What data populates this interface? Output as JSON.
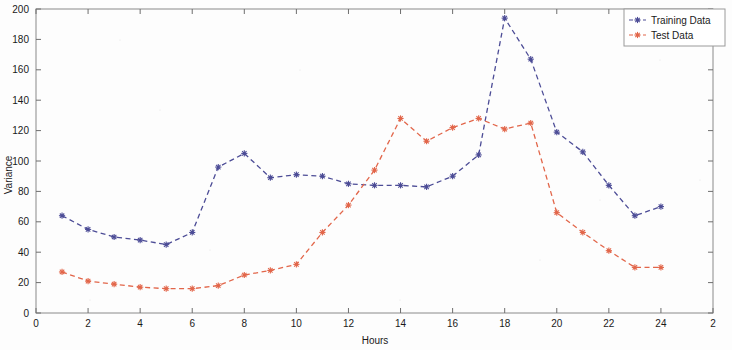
{
  "chart_data": {
    "type": "line",
    "title": "",
    "xlabel": "Hours",
    "ylabel": "Variance",
    "xlim": [
      0,
      26
    ],
    "ylim": [
      0,
      200
    ],
    "xticks": [
      0,
      2,
      4,
      6,
      8,
      10,
      12,
      14,
      16,
      18,
      20,
      22,
      24,
      26
    ],
    "xtick_labels": [
      "0",
      "2",
      "4",
      "6",
      "8",
      "10",
      "12",
      "14",
      "16",
      "18",
      "20",
      "22",
      "24",
      "2"
    ],
    "yticks": [
      0,
      20,
      40,
      60,
      80,
      100,
      120,
      140,
      160,
      180,
      200
    ],
    "ytick_labels": [
      "0",
      "20",
      "40",
      "60",
      "80",
      "100",
      "120",
      "140",
      "160",
      "180",
      "200"
    ],
    "grid": false,
    "legend_position": "top-right",
    "x": [
      1,
      2,
      3,
      4,
      5,
      6,
      7,
      8,
      9,
      10,
      11,
      12,
      13,
      14,
      15,
      16,
      17,
      18,
      19,
      20,
      21,
      22,
      23,
      24
    ],
    "series": [
      {
        "name": "Training Data",
        "color": "#4c4c96",
        "linestyle": "dashed",
        "marker": "star",
        "values": [
          64,
          55,
          50,
          48,
          45,
          53,
          96,
          105,
          89,
          91,
          90,
          85,
          84,
          84,
          83,
          90,
          104,
          194,
          167,
          119,
          106,
          84,
          64,
          70
        ]
      },
      {
        "name": "Test Data",
        "color": "#e2664a",
        "linestyle": "dashed",
        "marker": "star",
        "values": [
          27,
          21,
          19,
          17,
          16,
          16,
          18,
          25,
          28,
          32,
          53,
          71,
          94,
          128,
          113,
          122,
          128,
          121,
          125,
          66,
          53,
          41,
          30,
          30
        ]
      }
    ]
  },
  "legend": {
    "entries": [
      {
        "label": "Training Data"
      },
      {
        "label": "Test Data"
      }
    ]
  },
  "axes": {
    "x_title": "Hours",
    "y_title": "Variance"
  }
}
